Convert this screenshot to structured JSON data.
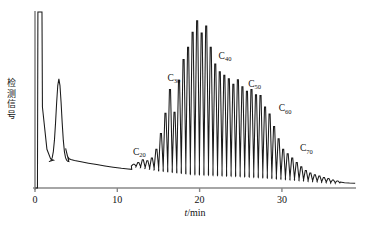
{
  "chart_data": {
    "type": "line",
    "title": "",
    "subtitle": "",
    "xlabel": "t/min",
    "xlabel_italic_part": "t",
    "xlabel_rest": "/min",
    "ylabel": "检测信号",
    "ylabel_chars": [
      "检",
      "测",
      "信",
      "号"
    ],
    "xlim": [
      0,
      39
    ],
    "ylim": [
      0,
      100
    ],
    "xticks": [
      0,
      10,
      20,
      30
    ],
    "xtick_labels": [
      "0",
      "10",
      "20",
      "30"
    ],
    "yticks": [],
    "ytick_labels": [],
    "grid": false,
    "legend": false,
    "axis_color": "#888888",
    "trace_color": "#1a1a1a",
    "background": "#ffffff",
    "annotations": [
      {
        "label": "C20",
        "text": "C",
        "sub": "20",
        "x": 11.9,
        "y": 19.0
      },
      {
        "label": "C30",
        "text": "C",
        "sub": "30",
        "x": 16.1,
        "y": 61.0
      },
      {
        "label": "C40",
        "text": "C",
        "sub": "40",
        "x": 22.3,
        "y": 73.5
      },
      {
        "label": "C50",
        "text": "C",
        "sub": "50",
        "x": 25.9,
        "y": 57.5
      },
      {
        "label": "C60",
        "text": "C",
        "sub": "60",
        "x": 29.6,
        "y": 43.5
      },
      {
        "label": "C70",
        "text": "C",
        "sub": "70",
        "x": 32.2,
        "y": 21.0
      }
    ],
    "solvent_peaks": [
      {
        "name": "injection-peak",
        "x": 0.6,
        "height": 100,
        "clipped": true,
        "width": 0.55
      },
      {
        "name": "solvent-peak",
        "x": 2.9,
        "height": 62,
        "clipped": false,
        "width": 0.7
      }
    ],
    "baseline_points": [
      {
        "x": 4.3,
        "y": 22.5
      },
      {
        "x": 6.0,
        "y": 19.5
      },
      {
        "x": 9.0,
        "y": 16.0
      },
      {
        "x": 12.0,
        "y": 12.5
      },
      {
        "x": 15.0,
        "y": 10.0
      },
      {
        "x": 19.0,
        "y": 8.0
      },
      {
        "x": 24.0,
        "y": 7.0
      },
      {
        "x": 28.0,
        "y": 6.0
      },
      {
        "x": 32.0,
        "y": 4.5
      },
      {
        "x": 36.0,
        "y": 3.0
      },
      {
        "x": 39.0,
        "y": 2.6
      }
    ],
    "series": [
      {
        "name": "n-alkane oligomer homologue series",
        "comment": "Each point is one resolved chromatographic peak: x = retention time in min, y = relative detector signal (0-100).",
        "x": [
          12.0,
          12.55,
          13.1,
          13.65,
          14.2,
          14.75,
          15.3,
          15.85,
          16.4,
          16.95,
          17.5,
          18.05,
          18.6,
          19.15,
          19.7,
          20.25,
          20.8,
          21.35,
          21.9,
          22.45,
          23.0,
          23.55,
          24.1,
          24.65,
          25.2,
          25.75,
          26.3,
          26.85,
          27.4,
          27.95,
          28.5,
          29.05,
          29.6,
          30.15,
          30.7,
          31.25,
          31.8,
          32.35,
          32.9,
          33.45,
          34.0,
          34.55,
          35.1,
          35.65,
          36.2,
          36.75
        ],
        "values": [
          13.5,
          14.5,
          16.0,
          15.5,
          17.0,
          22.0,
          31.0,
          42.5,
          56.0,
          43.0,
          61.0,
          73.0,
          80.0,
          88.5,
          95.0,
          88.0,
          92.0,
          80.0,
          70.5,
          66.0,
          64.0,
          62.0,
          59.0,
          61.5,
          57.5,
          55.0,
          56.0,
          53.0,
          52.5,
          46.0,
          42.0,
          35.0,
          28.0,
          22.0,
          19.5,
          17.0,
          14.5,
          12.0,
          10.0,
          8.5,
          7.5,
          6.8,
          6.0,
          5.4,
          4.6,
          4.0
        ]
      }
    ]
  },
  "figure": {
    "plot_area": {
      "left": 35,
      "right": 356,
      "top": 12,
      "bottom": 188
    }
  }
}
